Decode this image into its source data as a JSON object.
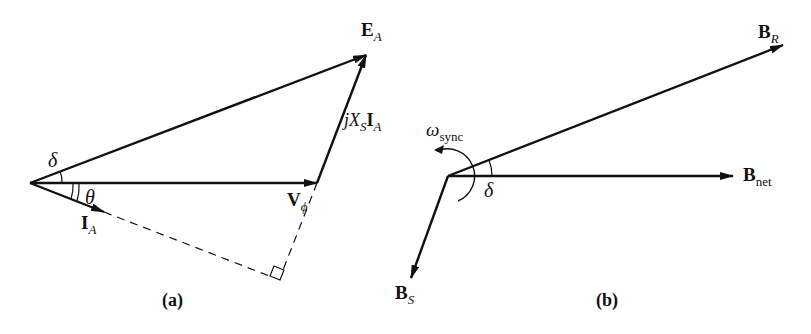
{
  "panel_a": {
    "caption": "(a)",
    "vectors": {
      "E_A": {
        "main": "E",
        "sub": "A"
      },
      "V_phi": {
        "main": "V",
        "sub": "ϕ"
      },
      "I_A": {
        "main": "I",
        "sub": "A"
      },
      "jXsIa": {
        "j": "j",
        "X": "X",
        "S": "S",
        "I": "I",
        "A": "A"
      }
    },
    "angles": {
      "delta": "δ",
      "theta": "θ"
    }
  },
  "panel_b": {
    "caption": "(b)",
    "vectors": {
      "B_R": {
        "main": "B",
        "sub": "R"
      },
      "B_net": {
        "main": "B",
        "sub": "net"
      },
      "B_S": {
        "main": "B",
        "sub": "S"
      }
    },
    "angles": {
      "delta": "δ"
    },
    "rotation": {
      "main": "ω",
      "sub": "sync"
    }
  }
}
